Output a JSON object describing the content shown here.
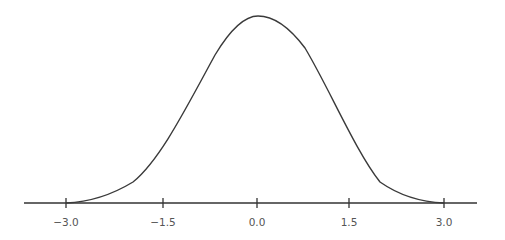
{
  "chart_data": {
    "type": "line",
    "title": "",
    "xlabel": "",
    "ylabel": "",
    "xlim": [
      -3.6,
      3.6
    ],
    "ylim": [
      0,
      0.4
    ],
    "grid": false,
    "legend": null,
    "x_ticks": [
      -3.0,
      -1.5,
      0.0,
      1.5,
      3.0
    ],
    "x_tick_labels": [
      "−3.0",
      "−1.5",
      "0.0",
      "1.5",
      "3.0"
    ],
    "series": [
      {
        "name": "density",
        "x": [
          -3.0,
          -2.5,
          -2.0,
          -1.5,
          -1.0,
          -0.5,
          0.0,
          0.5,
          1.0,
          1.5,
          2.0,
          2.5,
          3.0
        ],
        "y": [
          0.0,
          0.01,
          0.05,
          0.12,
          0.24,
          0.35,
          0.4,
          0.35,
          0.24,
          0.12,
          0.05,
          0.01,
          0.0
        ]
      }
    ],
    "colors": {
      "line": "#3a3a3a",
      "axis": "#333333",
      "labels": "#555555"
    }
  }
}
